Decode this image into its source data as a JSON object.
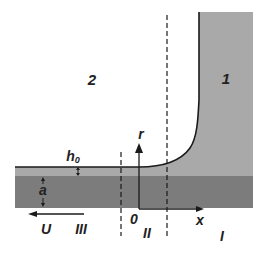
{
  "diagram": {
    "regions": {
      "fluid_1": "1",
      "fluid_2": "2"
    },
    "zones": {
      "zone_I": "I",
      "zone_II": "II",
      "zone_III": "III"
    },
    "labels": {
      "film_thickness": "h",
      "film_thickness_subscript": "0",
      "substrate_thickness": "a",
      "velocity": "U",
      "origin": "0",
      "x_axis": "x",
      "r_axis": "r"
    },
    "colors": {
      "fluid_1": "#a9a9a9",
      "film": "#a9a9a9",
      "substrate": "#7c7c7c",
      "lines": "#1a1a1a",
      "background": "#ffffff"
    }
  }
}
